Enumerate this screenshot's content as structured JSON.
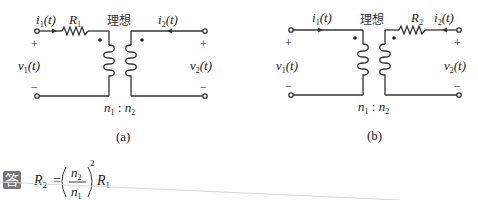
{
  "circuit_a": {
    "caption": "(a)",
    "current_in": "i",
    "current_in_sub": "1",
    "current_out": "i",
    "current_out_sub": "2",
    "arg": "(t)",
    "resistor": "R",
    "resistor_sub": "1",
    "ideal_label": "理想",
    "voltage_left": "v",
    "voltage_left_sub": "1",
    "voltage_right": "v",
    "voltage_right_sub": "2",
    "plus": "+",
    "minus": "−",
    "ratio_n1": "n",
    "ratio_n1_sub": "1",
    "ratio_sep": " : ",
    "ratio_n2": "n",
    "ratio_n2_sub": "2"
  },
  "circuit_b": {
    "caption": "(b)",
    "current_in": "i",
    "current_in_sub": "1",
    "current_out": "i",
    "current_out_sub": "2",
    "arg": "(t)",
    "resistor": "R",
    "resistor_sub": "2",
    "ideal_label": "理想",
    "voltage_left": "v",
    "voltage_left_sub": "1",
    "voltage_right": "v",
    "voltage_right_sub": "2",
    "plus": "+",
    "minus": "−",
    "ratio_n1": "n",
    "ratio_n1_sub": "1",
    "ratio_sep": " : ",
    "ratio_n2": "n",
    "ratio_n2_sub": "2"
  },
  "answer": {
    "badge": "答",
    "lhs": "R",
    "lhs_sub": "2",
    "equals": "=",
    "num": "n",
    "num_sub": "2",
    "den": "n",
    "den_sub": "1",
    "exponent": "2",
    "rhs": "R",
    "rhs_sub": "1"
  },
  "colors": {
    "wire": "#333333",
    "badge_bg": "#777777",
    "text": "#222222"
  }
}
